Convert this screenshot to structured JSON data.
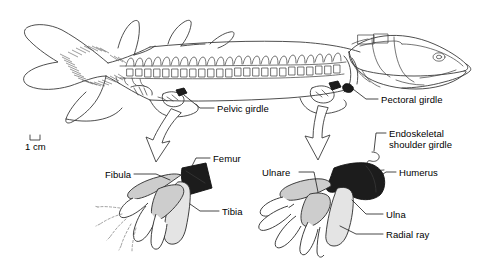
{
  "figure": {
    "scale_bar": {
      "label": "1 cm"
    },
    "body_labels": [
      {
        "id": "pelvic-girdle",
        "text": "Pelvic girdle"
      },
      {
        "id": "pectoral-girdle",
        "text": "Pectoral girdle"
      }
    ],
    "pelvic_fin_labels": [
      {
        "id": "fibula",
        "text": "Fibula"
      },
      {
        "id": "femur",
        "text": "Femur"
      },
      {
        "id": "tibia",
        "text": "Tibia"
      }
    ],
    "pectoral_fin_labels": [
      {
        "id": "ulnare",
        "text": "Ulnare"
      },
      {
        "id": "endoskeletal-shoulder-girdle",
        "text": "Endoskeletal\nshoulder girdle"
      },
      {
        "id": "humerus",
        "text": "Humerus"
      },
      {
        "id": "ulna",
        "text": "Ulna"
      },
      {
        "id": "radial-ray",
        "text": "Radial ray"
      }
    ],
    "colors": {
      "outline": "#3b3b3b",
      "dark_bone": "#1c1c1c",
      "mid_bone": "#c9c9c9",
      "light_bone": "#e2e2e2",
      "white_bone": "#ffffff",
      "text": "#000000",
      "background": "#ffffff"
    }
  }
}
